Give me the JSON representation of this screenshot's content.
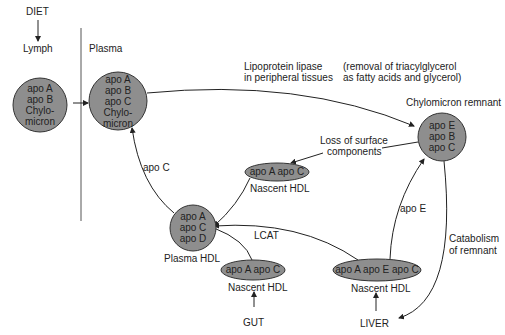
{
  "sources": {
    "diet": "DIET",
    "gut": "GUT",
    "liver": "LIVER"
  },
  "compartments": {
    "lymph": "Lymph",
    "plasma": "Plasma"
  },
  "nodes": {
    "lymph_chylomicron": {
      "lines": [
        "apo A",
        "apo B",
        "Chylo-",
        "micron"
      ]
    },
    "plasma_chylomicron": {
      "lines": [
        "apo A",
        "apo B",
        "apo C",
        "Chylo-",
        "micron"
      ]
    },
    "chylomicron_remnant": {
      "title": "Chylomicron remnant",
      "lines": [
        "apo E",
        "apo B",
        "apo C"
      ]
    },
    "nascent_hdl_top": {
      "text": "apo A apo C",
      "caption": "Nascent HDL"
    },
    "plasma_hdl": {
      "lines": [
        "apo A",
        "apo C",
        "apo D"
      ],
      "caption": "Plasma HDL"
    },
    "nascent_hdl_gut": {
      "text": "apo A apo C",
      "caption": "Nascent HDL"
    },
    "nascent_hdl_liver": {
      "text": "apo A apo E apo C",
      "caption": "Nascent HDL"
    }
  },
  "annotations": {
    "lipase_1": "Lipoprotein lipase",
    "lipase_2": "in peripheral tissues",
    "removal_1": "(removal of triacylglycerol",
    "removal_2": "as fatty acids and glycerol)",
    "loss_1": "Loss of surface",
    "loss_2": "components",
    "apo_c": "apo C",
    "lcat": "LCAT",
    "apo_e": "apo E",
    "catabolism_1": "Catabolism",
    "catabolism_2": "of remnant"
  },
  "colors": {
    "node_fill": "#8e8e8e",
    "stroke": "#333333",
    "background": "#ffffff"
  }
}
